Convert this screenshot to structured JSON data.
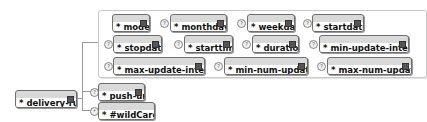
{
  "root": {
    "name": "delivery-rule",
    "type": "delivery-ruleType"
  },
  "group_nodes": [
    {
      "name": "mode",
      "type": "feature",
      "optional": false
    },
    {
      "name": "monthday",
      "type": "NMTOKENS",
      "optional": true
    },
    {
      "name": "weekday",
      "type": "NMTOKENS",
      "optional": true
    },
    {
      "name": "startdate",
      "type": "dateTime",
      "optional": true
    },
    {
      "name": "stopdate",
      "type": "dateTime",
      "optional": true
    },
    {
      "name": "starttime",
      "type": "time",
      "optional": true
    },
    {
      "name": "duration",
      "type": "duration",
      "optional": true
    },
    {
      "name": "min-update-interval",
      "type": "duration",
      "optional": true
    },
    {
      "name": "max-update-interval",
      "type": "duration",
      "optional": true
    },
    {
      "name": "min-num-updates",
      "type": "integer",
      "optional": true
    },
    {
      "name": "max-num-updates",
      "type": "integer",
      "optional": true
    }
  ],
  "push_url": {
    "name": "push-url",
    "type": "urlAccessType"
  },
  "wildcard": {
    "name": "#wildCard",
    "type": ""
  },
  "symbols": {
    "required": "*",
    "optional": "?",
    "any": "*"
  }
}
